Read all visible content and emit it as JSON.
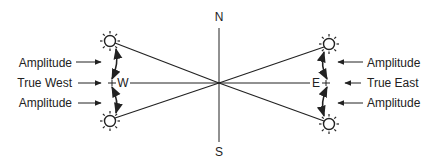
{
  "diagram": {
    "compass": {
      "north": "N",
      "south": "S",
      "west": "W",
      "east": "E"
    },
    "left_labels": {
      "upper": "Amplitude",
      "middle": "True West",
      "lower": "Amplitude"
    },
    "right_labels": {
      "upper": "Amplitude",
      "middle": "True East",
      "lower": "Amplitude"
    },
    "icons": {
      "sun": "sun-icon",
      "arrow": "arrow-icon"
    },
    "colors": {
      "stroke": "#222222",
      "background": "#ffffff"
    }
  }
}
